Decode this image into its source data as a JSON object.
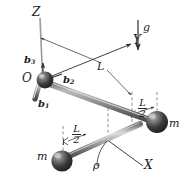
{
  "figure": {
    "name": "rigid-body-rod-with-two-masses-diagram",
    "colors": {
      "line": "#2b2b2b",
      "sphere_dark": "#2d2d2d",
      "sphere_mid": "#555555",
      "sphere_highlight": "#b9b9b9",
      "rod_light": "#d0d0d0",
      "rod_mid": "#8d8d8d",
      "rod_dark": "#4a4a4a",
      "axis_gray": "#8a8a8a",
      "dash": "#777777",
      "background": "#ffffff"
    }
  },
  "labels": {
    "axis_z": "Z",
    "axis_y": "Y",
    "axis_x": "X",
    "origin": "O",
    "basis_1": "b",
    "basis_1_sub": "1",
    "basis_2": "b",
    "basis_2_sub": "2",
    "basis_3": "b",
    "basis_3_sub": "3",
    "gravity": "g",
    "length_L": "L",
    "half_L_num": "L",
    "half_L_den": "2",
    "mass_left": "m",
    "mass_right": "m",
    "angle_rho": "ρ"
  },
  "geometry": {
    "origin_point": [
      44,
      80
    ],
    "rod_end_point": [
      112,
      143
    ],
    "mass_left_point": [
      60,
      160
    ],
    "mass_right_point": [
      155,
      122
    ],
    "z_axis_top": [
      40,
      16
    ],
    "y_axis_end": [
      138,
      42
    ],
    "x_axis_end": [
      148,
      168
    ],
    "gravity_arrow": [
      139,
      22,
      139,
      52
    ],
    "rod_length_label": "L",
    "half_length_label": "L/2"
  }
}
